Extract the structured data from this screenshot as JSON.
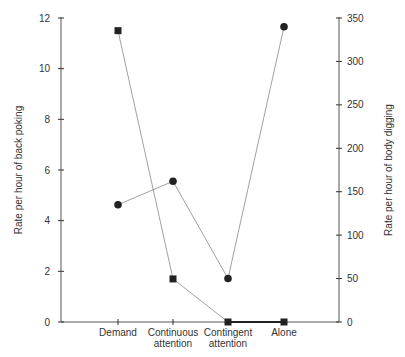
{
  "chart_data": {
    "type": "line",
    "title": "",
    "xlabel": "",
    "categories": [
      "Demand",
      "Continuous attention",
      "Contingent attention",
      "Alone"
    ],
    "category_lines": [
      [
        "Demand"
      ],
      [
        "Continuous",
        "attention"
      ],
      [
        "Contingent",
        "attention"
      ],
      [
        "Alone"
      ]
    ],
    "left_axis": {
      "label": "Rate per hour of back poking",
      "ylim": [
        0,
        12
      ],
      "ticks": [
        0,
        2,
        4,
        6,
        8,
        10,
        12
      ]
    },
    "right_axis": {
      "label": "Rate per hour of body digging",
      "ylim": [
        0,
        350
      ],
      "ticks": [
        0,
        50,
        100,
        150,
        200,
        250,
        300,
        350
      ]
    },
    "series": [
      {
        "name": "Back poking",
        "marker": "square",
        "axis": "left",
        "values": [
          11.5,
          1.7,
          0,
          0
        ]
      },
      {
        "name": "Body digging",
        "marker": "circle",
        "axis": "right",
        "values": [
          135,
          162,
          50,
          340
        ]
      }
    ],
    "grid": false,
    "legend": "none"
  }
}
